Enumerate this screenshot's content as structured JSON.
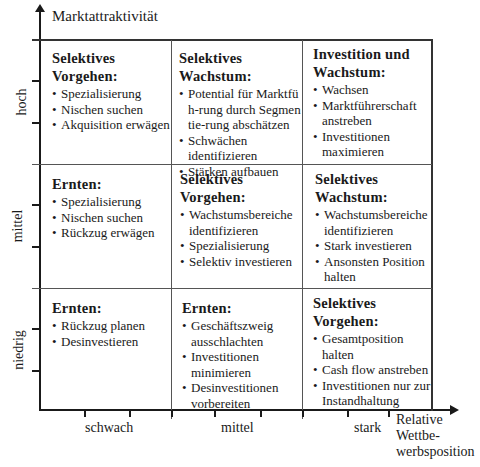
{
  "y_axis": {
    "title": "Marktattraktivität",
    "levels": [
      "hoch",
      "mittel",
      "niedrig"
    ]
  },
  "x_axis": {
    "title_lines": [
      "Relative",
      "Wettbe-",
      "werbsposition"
    ],
    "levels": [
      "schwach",
      "mittel",
      "stark"
    ]
  },
  "matrix": {
    "rows": [
      {
        "level": "hoch",
        "cells": [
          {
            "title_lines": [
              "Selektives",
              "Vorgehen:"
            ],
            "items": [
              "Spezialisierung",
              "Nischen suchen",
              "Akquisition erwägen"
            ]
          },
          {
            "title_lines": [
              "Selektives",
              "Wachstum:"
            ],
            "items": [
              "Potential für Marktfüh-rung durch Segmentie-rung abschätzen",
              "Schwächen identifizieren",
              "Stärken aufbauen"
            ]
          },
          {
            "title_lines": [
              "Investition und",
              "Wachstum:"
            ],
            "items": [
              "Wachsen",
              "Marktführerschaft anstreben",
              "Investitionen maximieren"
            ]
          }
        ]
      },
      {
        "level": "mittel",
        "cells": [
          {
            "title_lines": [
              "Ernten:"
            ],
            "items": [
              "Spezialisierung",
              "Nischen suchen",
              "Rückzug erwägen"
            ]
          },
          {
            "title_lines": [
              "Selektives",
              "Vorgehen:"
            ],
            "items": [
              "Wachstumsbereiche identifizieren",
              "Spezialisierung",
              "Selektiv investieren"
            ]
          },
          {
            "title_lines": [
              "Selektives",
              "Wachstum:"
            ],
            "items": [
              "Wachstumsbereiche identifizieren",
              "Stark investieren",
              "Ansonsten Position halten"
            ]
          }
        ]
      },
      {
        "level": "niedrig",
        "cells": [
          {
            "title_lines": [
              "Ernten:"
            ],
            "items": [
              "Rückzug planen",
              "Desinvestieren"
            ]
          },
          {
            "title_lines": [
              "Ernten:"
            ],
            "items": [
              "Geschäftszweig ausschlachten",
              "Investitionen minimieren",
              "Desinvestitionen vorbereiten"
            ]
          },
          {
            "title_lines": [
              "Selektives",
              "Vorgehen:"
            ],
            "items": [
              "Gesamtposition halten",
              "Cash flow anstreben",
              "Investitionen nur zur Instandhaltung"
            ]
          }
        ]
      }
    ]
  }
}
